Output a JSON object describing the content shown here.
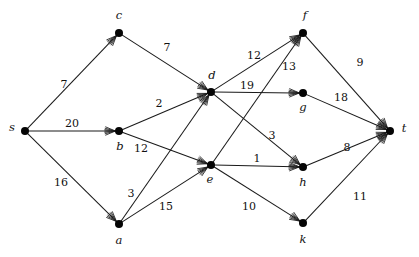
{
  "figure": {
    "type": "directed-weighted-graph",
    "width": 419,
    "height": 257,
    "background_color": "#ffffff",
    "node_color": "#050505",
    "edge_color": "#1a1a1a",
    "label_color": "#111111"
  },
  "nodes": [
    {
      "id": "s",
      "label": "s",
      "x": 25,
      "y": 131,
      "label_x": 12,
      "label_y": 128
    },
    {
      "id": "c",
      "label": "c",
      "x": 119,
      "y": 33,
      "label_x": 119,
      "label_y": 16
    },
    {
      "id": "b",
      "label": "b",
      "x": 119,
      "y": 131,
      "label_x": 120,
      "label_y": 147
    },
    {
      "id": "a",
      "label": "a",
      "x": 119,
      "y": 224,
      "label_x": 119,
      "label_y": 241
    },
    {
      "id": "d",
      "label": "d",
      "x": 211,
      "y": 92,
      "label_x": 212,
      "label_y": 76
    },
    {
      "id": "e",
      "label": "e",
      "x": 211,
      "y": 165,
      "label_x": 210,
      "label_y": 180
    },
    {
      "id": "f",
      "label": "f",
      "x": 303,
      "y": 33,
      "label_x": 305,
      "label_y": 16
    },
    {
      "id": "g",
      "label": "g",
      "x": 303,
      "y": 93,
      "label_x": 303,
      "label_y": 108
    },
    {
      "id": "h",
      "label": "h",
      "x": 303,
      "y": 167,
      "label_x": 303,
      "label_y": 183
    },
    {
      "id": "k",
      "label": "k",
      "x": 303,
      "y": 223,
      "label_x": 303,
      "label_y": 240
    },
    {
      "id": "t",
      "label": "t",
      "x": 390,
      "y": 131,
      "label_x": 404,
      "label_y": 129
    }
  ],
  "edges": [
    {
      "id": "s-c",
      "from": "s",
      "to": "c",
      "weight": "7",
      "label_x": 64,
      "label_y": 84
    },
    {
      "id": "s-b",
      "from": "s",
      "to": "b",
      "weight": "20",
      "label_x": 72,
      "label_y": 123
    },
    {
      "id": "s-a",
      "from": "s",
      "to": "a",
      "weight": "16",
      "label_x": 61,
      "label_y": 182
    },
    {
      "id": "c-d",
      "from": "c",
      "to": "d",
      "weight": "7",
      "label_x": 167,
      "label_y": 47
    },
    {
      "id": "b-d",
      "from": "b",
      "to": "d",
      "weight": "2",
      "label_x": 159,
      "label_y": 103
    },
    {
      "id": "b-e",
      "from": "b",
      "to": "e",
      "weight": "12",
      "label_x": 141,
      "label_y": 148
    },
    {
      "id": "a-d",
      "from": "a",
      "to": "d",
      "weight": "3",
      "label_x": 131,
      "label_y": 193
    },
    {
      "id": "a-e",
      "from": "a",
      "to": "e",
      "weight": "15",
      "label_x": 166,
      "label_y": 206
    },
    {
      "id": "d-f",
      "from": "d",
      "to": "f",
      "weight": "12",
      "label_x": 254,
      "label_y": 55
    },
    {
      "id": "d-g",
      "from": "d",
      "to": "g",
      "weight": "19",
      "label_x": 247,
      "label_y": 85
    },
    {
      "id": "d-h",
      "from": "d",
      "to": "h",
      "weight": "3",
      "label_x": 272,
      "label_y": 135
    },
    {
      "id": "e-f",
      "from": "e",
      "to": "f",
      "weight": "13",
      "label_x": 289,
      "label_y": 66
    },
    {
      "id": "e-h",
      "from": "e",
      "to": "h",
      "weight": "1",
      "label_x": 257,
      "label_y": 158
    },
    {
      "id": "e-k",
      "from": "e",
      "to": "k",
      "weight": "10",
      "label_x": 249,
      "label_y": 206
    },
    {
      "id": "f-t",
      "from": "f",
      "to": "t",
      "weight": "9",
      "label_x": 360,
      "label_y": 62
    },
    {
      "id": "g-t",
      "from": "g",
      "to": "t",
      "weight": "18",
      "label_x": 341,
      "label_y": 97
    },
    {
      "id": "h-t",
      "from": "h",
      "to": "t",
      "weight": "8",
      "label_x": 347,
      "label_y": 147
    },
    {
      "id": "k-t",
      "from": "k",
      "to": "t",
      "weight": "11",
      "label_x": 360,
      "label_y": 196
    }
  ]
}
